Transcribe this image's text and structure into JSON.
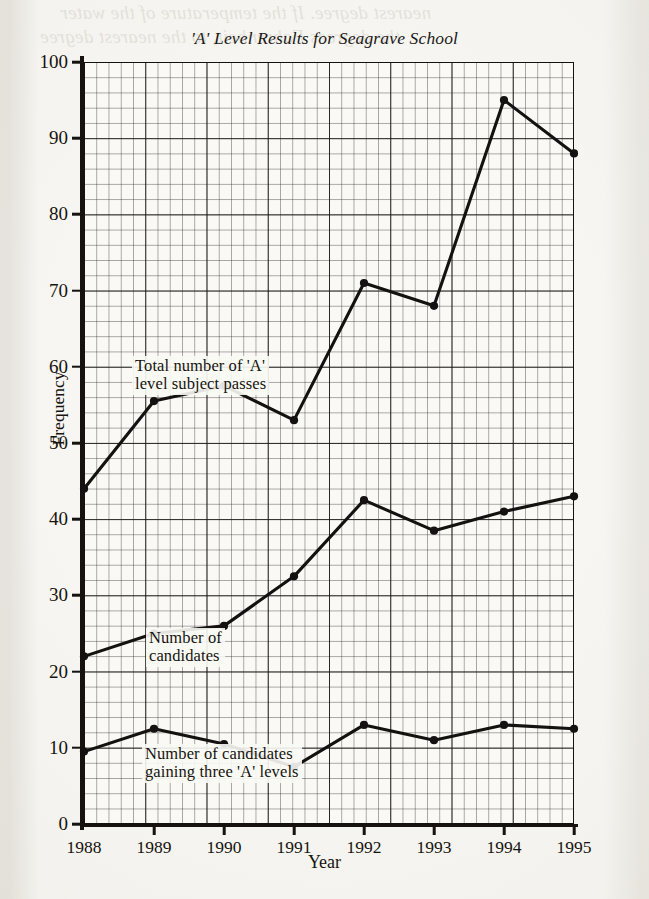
{
  "page": {
    "bleed_through_text": "nearest degree.  If the temperature of the water",
    "bleed_through_text_2": "the degrees Fahrenheit, to the nearest degree"
  },
  "chart_data": {
    "type": "line",
    "title": "'A' Level Results for Seagrave School",
    "xlabel": "Year",
    "ylabel": "Frequency",
    "categories": [
      "1988",
      "1989",
      "1990",
      "1991",
      "1992",
      "1993",
      "1994",
      "1995"
    ],
    "x": [
      1988,
      1989,
      1990,
      1991,
      1992,
      1993,
      1994,
      1995
    ],
    "xlim": [
      1988,
      1995
    ],
    "ylim": [
      0,
      100
    ],
    "y_ticks": [
      "0",
      "10",
      "20",
      "30",
      "40",
      "50",
      "60",
      "70",
      "80",
      "90",
      "100"
    ],
    "y_tick_values": [
      0,
      10,
      20,
      30,
      40,
      50,
      60,
      70,
      80,
      90,
      100
    ],
    "y_tick_interval": 10,
    "grid": true,
    "grid_style": "graph-paper, 2mm minor / 1cm major",
    "legend_position": "inline-annotations",
    "marker": "filled-circle",
    "line_color": "#141110",
    "series": [
      {
        "name": "Total number of 'A' level subject passes",
        "label_lines": "Total number of 'A'\nlevel subject passes",
        "values": [
          44,
          55.5,
          57.5,
          53,
          71,
          68,
          95,
          88
        ]
      },
      {
        "name": "Number of candidates",
        "label_lines": "Number of\ncandidates",
        "values": [
          22,
          25,
          26,
          32.5,
          42.5,
          38.5,
          41,
          43
        ]
      },
      {
        "name": "Number of candidates gaining three 'A' levels",
        "label_lines": "Number of candidates\ngaining three 'A' levels",
        "values": [
          9.5,
          12.5,
          10.5,
          7.5,
          13,
          11,
          13,
          12.5
        ]
      }
    ]
  }
}
